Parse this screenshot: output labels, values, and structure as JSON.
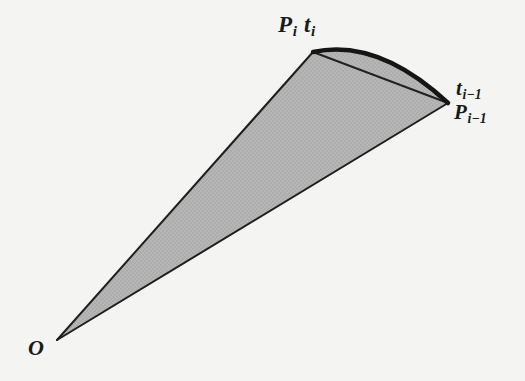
{
  "figure": {
    "background_color": "#f4f4f2",
    "fill_color": "#b5b5b5",
    "stroke_color": "#1a1a1a",
    "labels": {
      "apex": {
        "point": "P",
        "point_sub": "i",
        "tangent": "t",
        "tangent_sub": "i"
      },
      "right_tangent": {
        "symbol": "t",
        "sub": "i−1"
      },
      "right_point": {
        "symbol": "P",
        "sub": "i−1"
      },
      "origin": {
        "symbol": "O"
      }
    },
    "geometry": {
      "origin_xy": [
        57,
        340
      ],
      "p_i_xy": [
        313,
        52
      ],
      "p_i_minus_1_xy": [
        448,
        103
      ],
      "arc_apex_xy": [
        378,
        46
      ],
      "chord_width_px": 2,
      "arc_width_px": 4,
      "edge_width_px": 2
    }
  }
}
